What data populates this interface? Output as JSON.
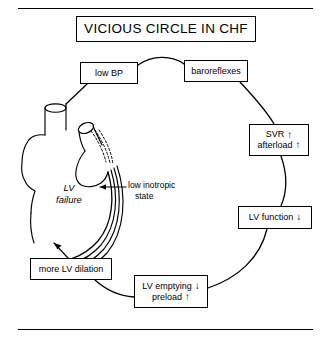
{
  "figure": {
    "title": "VICIOUS CIRCLE IN CHF",
    "nodes": {
      "low_bp": "low BP",
      "baroreflexes": "baroreflexes",
      "svr_line1": "SVR",
      "svr_line1_arrow": "↑",
      "svr_line2": "afterload",
      "svr_line2_arrow": "↑",
      "lv_function": "LV function",
      "lv_function_arrow": "↓",
      "lv_emptying": "LV emptying",
      "lv_emptying_arrow": "↓",
      "preload": "preload",
      "preload_arrow": "↑",
      "more_lv_dilation": "more LV dilation"
    },
    "annotations": {
      "lv_failure_line1": "LV",
      "lv_failure_line2": "failure",
      "inotropic_line1": "low inotropic",
      "inotropic_line2": "state"
    },
    "colors": {
      "ink": "#000000",
      "background": "#ffffff"
    }
  }
}
